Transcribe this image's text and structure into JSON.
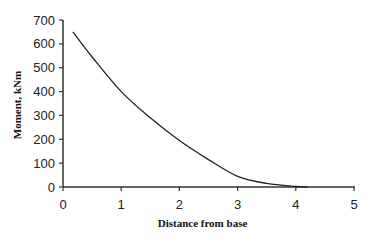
{
  "chart_data": {
    "type": "line",
    "title": "",
    "xlabel": "Distance from base",
    "ylabel": "Moment, kNm",
    "xlim": [
      0,
      5
    ],
    "ylim": [
      0,
      700
    ],
    "xticks": [
      0,
      1,
      2,
      3,
      4,
      5
    ],
    "yticks": [
      0,
      100,
      200,
      300,
      400,
      500,
      600,
      700
    ],
    "grid": false,
    "legend": null,
    "series": [
      {
        "name": "Moment",
        "x": [
          0.17,
          0.5,
          1.0,
          1.5,
          2.0,
          2.5,
          3.0,
          3.5,
          4.0,
          4.2
        ],
        "values": [
          650,
          545,
          400,
          290,
          195,
          115,
          45,
          15,
          2,
          0
        ]
      }
    ],
    "colors": {
      "line": "#222222",
      "axis": "#333333"
    }
  }
}
